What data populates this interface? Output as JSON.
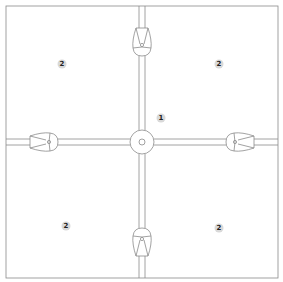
{
  "diagram": {
    "type": "plan-schematic",
    "colors": {
      "stroke": "#8a8a8a",
      "background": "#ffffff",
      "label_bg": "#d9d9d9"
    },
    "labels": [
      {
        "id": "center",
        "text": "1",
        "x": 161,
        "y": 118
      },
      {
        "id": "top-left",
        "text": "2",
        "x": 62,
        "y": 64
      },
      {
        "id": "top-right",
        "text": "2",
        "x": 219,
        "y": 64
      },
      {
        "id": "bottom-left",
        "text": "2",
        "x": 66,
        "y": 226
      },
      {
        "id": "bottom-right",
        "text": "2",
        "x": 219,
        "y": 228
      }
    ],
    "nodes": [
      {
        "id": "node-top",
        "direction": "down"
      },
      {
        "id": "node-bottom",
        "direction": "up"
      },
      {
        "id": "node-left",
        "direction": "right"
      },
      {
        "id": "node-right",
        "direction": "left"
      },
      {
        "id": "junction-center",
        "shape": "circle"
      }
    ]
  }
}
